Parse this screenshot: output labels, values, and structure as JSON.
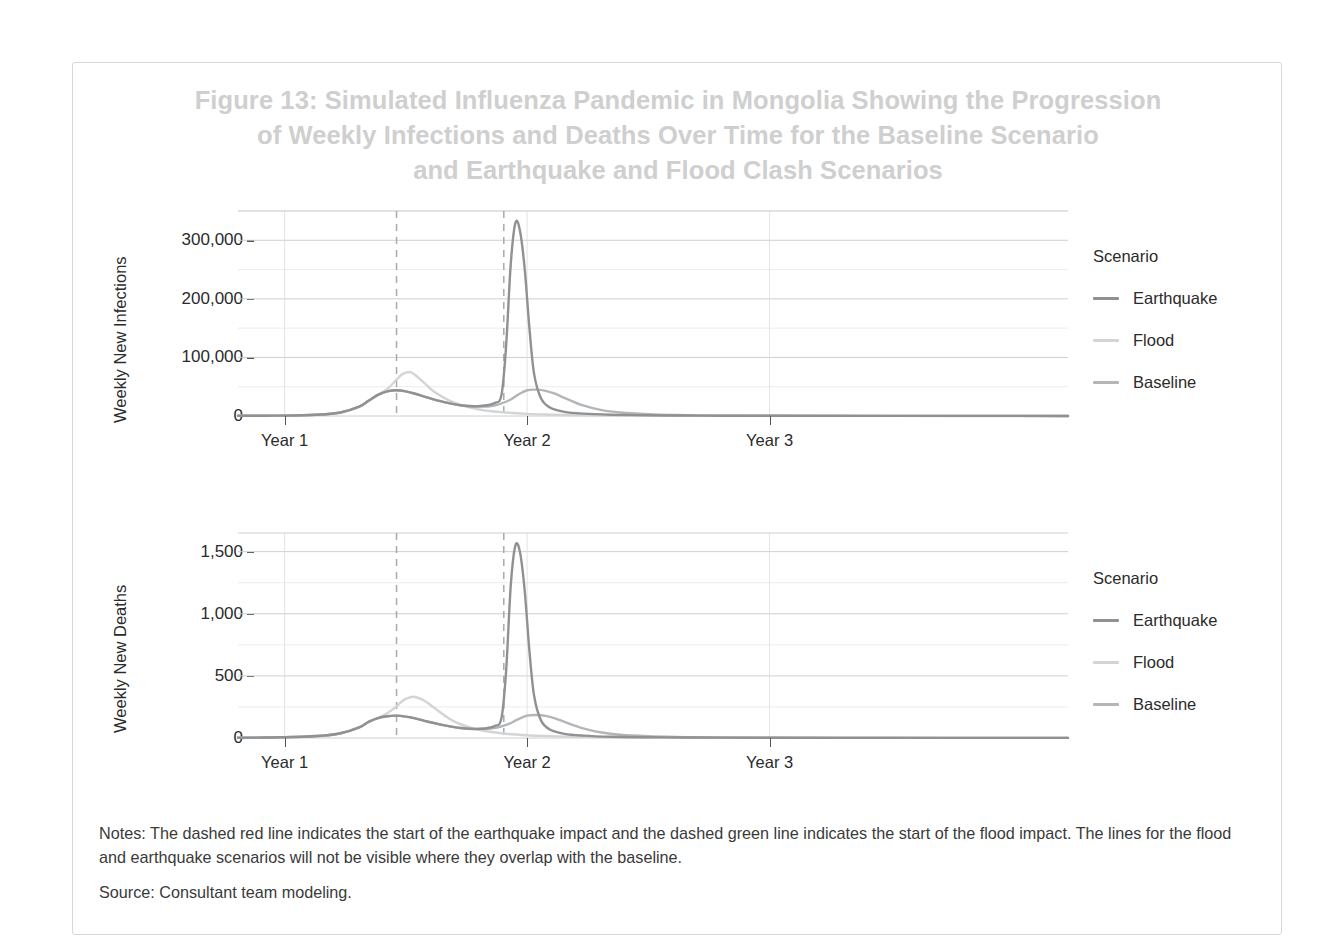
{
  "figure": {
    "title_lines": [
      "Figure 13: Simulated Influenza Pandemic in Mongolia Showing the Progression",
      "of Weekly Infections and Deaths Over Time for the Baseline Scenario",
      "and Earthquake and Flood Clash Scenarios"
    ],
    "title_color": "#cfcfcf",
    "frame_color": "#d8d8d8",
    "notes": "Notes: The dashed red line indicates the start of the earthquake impact and the dashed green line indicates the start of the flood impact. The lines for the flood and earthquake scenarios will not be visible where they overlap with the baseline.",
    "source": "Source: Consultant team modeling."
  },
  "legend": {
    "title": "Scenario",
    "items": [
      {
        "label": "Earthquake",
        "color": "#8f9193"
      },
      {
        "label": "Flood",
        "color": "#d2d4d6"
      },
      {
        "label": "Baseline",
        "color": "#b3b6b8"
      }
    ]
  },
  "chart_data": [
    {
      "type": "line",
      "id": "weekly-new-infections",
      "title": "",
      "xlabel": "",
      "ylabel": "Weekly New Infections",
      "ylim": [
        0,
        350000
      ],
      "yticks": [
        0,
        100000,
        200000,
        300000
      ],
      "ytick_labels": [
        "0",
        "100,000",
        "200,000",
        "300,000"
      ],
      "yminor_step": 50000,
      "xlim": [
        0,
        178
      ],
      "xticks": [
        10,
        62,
        114
      ],
      "xtick_labels": [
        "Year 1",
        "Year 2",
        "Year 3"
      ],
      "grid": true,
      "legend_position": "right",
      "annotations": [
        {
          "kind": "vline",
          "name": "flood-impact-start",
          "x": 34,
          "style": "dashed",
          "described_color": "green"
        },
        {
          "kind": "vline",
          "name": "earthquake-impact-start",
          "x": 57,
          "style": "dashed",
          "described_color": "red"
        }
      ],
      "series": [
        {
          "name": "Baseline",
          "color": "#b3b6b8",
          "peak_value": 45000,
          "peak_x": 62,
          "x": [
            0,
            6,
            12,
            18,
            22,
            26,
            28,
            30,
            32,
            34,
            36,
            38,
            40,
            44,
            48,
            52,
            55,
            58,
            60,
            62,
            64,
            66,
            68,
            70,
            74,
            78,
            82,
            88,
            94,
            100,
            110,
            125,
            140,
            160,
            178
          ],
          "values": [
            300,
            500,
            900,
            2500,
            6000,
            16000,
            26000,
            36000,
            42000,
            44000,
            42000,
            38000,
            33000,
            24000,
            18000,
            16000,
            18000,
            26000,
            36000,
            44000,
            45000,
            43000,
            38000,
            31000,
            18000,
            10000,
            6000,
            3200,
            1800,
            1100,
            600,
            350,
            250,
            150,
            120
          ]
        },
        {
          "name": "Flood",
          "color": "#d2d4d6",
          "peak_value": 75000,
          "peak_x": 37,
          "x": [
            0,
            6,
            12,
            18,
            22,
            26,
            28,
            30,
            32,
            34,
            35,
            36,
            37,
            38,
            40,
            42,
            46,
            50,
            54,
            58,
            62,
            66,
            70,
            76,
            84,
            92,
            100,
            110,
            125,
            140,
            160,
            178
          ],
          "values": [
            300,
            500,
            900,
            2500,
            6000,
            16000,
            26000,
            36000,
            46000,
            62000,
            70000,
            74000,
            75000,
            70000,
            56000,
            42000,
            24000,
            14000,
            8500,
            5500,
            3600,
            2500,
            1800,
            1100,
            600,
            400,
            280,
            200,
            150,
            130,
            120,
            110
          ]
        },
        {
          "name": "Earthquake",
          "color": "#8f9193",
          "peak_value": 330000,
          "peak_x": 59.5,
          "x": [
            0,
            6,
            12,
            18,
            22,
            26,
            28,
            30,
            32,
            34,
            36,
            38,
            40,
            44,
            48,
            52,
            55,
            56.5,
            57.5,
            58.5,
            59.5,
            60.5,
            61.5,
            62.5,
            63.5,
            65,
            67,
            70,
            74,
            80,
            88,
            96,
            104,
            115,
            130,
            150,
            178
          ],
          "values": [
            300,
            500,
            900,
            2500,
            6000,
            16000,
            26000,
            36000,
            42000,
            44000,
            42000,
            38000,
            33000,
            24000,
            18000,
            17000,
            22000,
            36000,
            120000,
            260000,
            330000,
            315000,
            250000,
            150000,
            72000,
            30000,
            14000,
            7000,
            4000,
            2200,
            1200,
            800,
            550,
            380,
            250,
            170,
            120
          ]
        }
      ]
    },
    {
      "type": "line",
      "id": "weekly-new-deaths",
      "title": "",
      "xlabel": "",
      "ylabel": "Weekly New Deaths",
      "ylim": [
        0,
        1650
      ],
      "yticks": [
        0,
        500,
        1000,
        1500
      ],
      "ytick_labels": [
        "0",
        "500",
        "1,000",
        "1,500"
      ],
      "yminor_step": 250,
      "xlim": [
        0,
        178
      ],
      "xticks": [
        10,
        62,
        114
      ],
      "xtick_labels": [
        "Year 1",
        "Year 2",
        "Year 3"
      ],
      "grid": true,
      "legend_position": "right",
      "annotations": [
        {
          "kind": "vline",
          "name": "flood-impact-start",
          "x": 34,
          "style": "dashed",
          "described_color": "green"
        },
        {
          "kind": "vline",
          "name": "earthquake-impact-start",
          "x": 57,
          "style": "dashed",
          "described_color": "red"
        }
      ],
      "series": [
        {
          "name": "Baseline",
          "color": "#b3b6b8",
          "peak_value": 185,
          "peak_x": 63,
          "x": [
            0,
            6,
            12,
            18,
            22,
            26,
            28,
            30,
            32,
            34,
            36,
            38,
            40,
            44,
            48,
            52,
            55,
            58,
            60,
            62,
            64,
            66,
            68,
            70,
            74,
            78,
            82,
            88,
            94,
            100,
            110,
            125,
            140,
            160,
            178
          ],
          "values": [
            2,
            4,
            8,
            18,
            38,
            86,
            130,
            160,
            175,
            180,
            172,
            158,
            138,
            104,
            80,
            72,
            80,
            112,
            150,
            180,
            185,
            178,
            158,
            130,
            78,
            44,
            26,
            14,
            8,
            5,
            3,
            2,
            2,
            1,
            1
          ]
        },
        {
          "name": "Flood",
          "color": "#d2d4d6",
          "peak_value": 330,
          "peak_x": 38,
          "x": [
            0,
            6,
            12,
            18,
            22,
            26,
            28,
            30,
            32,
            34,
            35,
            36,
            37,
            38,
            40,
            42,
            46,
            50,
            54,
            58,
            62,
            66,
            70,
            76,
            84,
            92,
            100,
            110,
            125,
            140,
            160,
            178
          ],
          "values": [
            2,
            4,
            8,
            18,
            38,
            86,
            130,
            160,
            200,
            255,
            290,
            315,
            328,
            330,
            300,
            245,
            140,
            82,
            50,
            32,
            22,
            16,
            11,
            7,
            4,
            3,
            2,
            2,
            1,
            1,
            1,
            1
          ]
        },
        {
          "name": "Earthquake",
          "color": "#8f9193",
          "peak_value": 1550,
          "peak_x": 60,
          "x": [
            0,
            6,
            12,
            18,
            22,
            26,
            28,
            30,
            32,
            34,
            36,
            38,
            40,
            44,
            48,
            52,
            55,
            56.5,
            57.5,
            58.5,
            59.5,
            60.5,
            61.5,
            62.5,
            63.5,
            65,
            67,
            70,
            74,
            80,
            88,
            96,
            104,
            115,
            130,
            150,
            178
          ],
          "values": [
            2,
            4,
            8,
            18,
            38,
            86,
            130,
            160,
            175,
            180,
            172,
            158,
            138,
            104,
            78,
            74,
            96,
            160,
            540,
            1230,
            1550,
            1490,
            1180,
            700,
            340,
            140,
            66,
            33,
            19,
            10,
            6,
            4,
            3,
            2,
            1,
            1,
            1
          ]
        }
      ]
    }
  ]
}
